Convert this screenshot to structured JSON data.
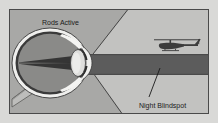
{
  "figure": {
    "title": "Night Blindspot",
    "labels": {
      "rods_active": "Rods Active",
      "night_blindspot": "Night Blindspot"
    },
    "objects": {
      "eye": "eye-cross-section",
      "helicopter": "helicopter-silhouette",
      "blindspot_band": "night-blindspot-band",
      "vision_cone": "field-of-view-cone",
      "optic_nerve": "optic-nerve",
      "lens": "eye-lens",
      "cornea": "cornea",
      "retina": "retina",
      "leader_line": "blindspot-leader-line"
    },
    "colors": {
      "page_background": "#d9d9d7",
      "frame_border": "#4a4a4a",
      "scene_background": "#a8a8a6",
      "cone_light": "#c2c2c0",
      "band_dark": "#5c5c5c",
      "eye_interior": "#8a8a88",
      "eye_dark_layer": "#3a3a3a",
      "sclera_white": "#efefed",
      "lens_light": "#dededc",
      "text": "#1a1a1a",
      "helicopter": "#3c3c3c"
    }
  }
}
